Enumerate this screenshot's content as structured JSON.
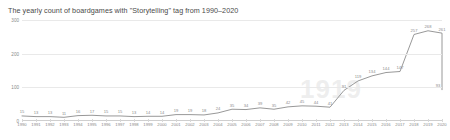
{
  "chart_data": {
    "type": "line",
    "title": "The yearly count of boardgames with \"Storytelling\" tag from 1990–2020",
    "xlabel": "",
    "ylabel": "",
    "ylim": [
      0,
      300
    ],
    "yticks": [
      0,
      100,
      200,
      300
    ],
    "grid": true,
    "legend": false,
    "line_color": "#8c8c8c",
    "categories": [
      "1990",
      "1991",
      "1992",
      "1993",
      "1994",
      "1995",
      "1996",
      "1997",
      "1998",
      "1999",
      "2000",
      "2001",
      "2002",
      "2003",
      "2004",
      "2005",
      "2006",
      "2007",
      "2008",
      "2009",
      "2010",
      "2011",
      "2012",
      "2013",
      "2014",
      "2015",
      "2016",
      "2017",
      "2018",
      "2019",
      "2020"
    ],
    "values": [
      15,
      13,
      13,
      11,
      16,
      17,
      15,
      15,
      13,
      14,
      14,
      19,
      19,
      18,
      24,
      35,
      34,
      39,
      35,
      42,
      45,
      44,
      41,
      91,
      119,
      134,
      144,
      147,
      257,
      268,
      261
    ],
    "final_point": {
      "year": "2020",
      "value": 93
    },
    "watermark": "1919"
  }
}
